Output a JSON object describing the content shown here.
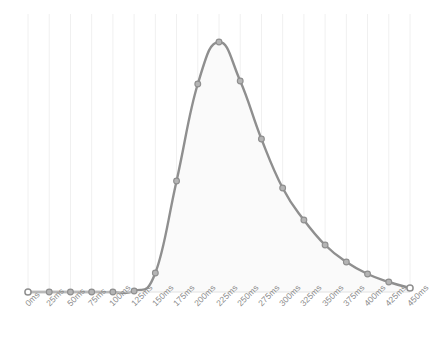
{
  "chart_data": {
    "type": "area",
    "title": "",
    "subtitle": "",
    "xlabel": "",
    "ylabel": "",
    "categories": [
      "0ms",
      "25ms",
      "50ms",
      "75ms",
      "100ms",
      "125ms",
      "150ms",
      "175ms",
      "200ms",
      "225ms",
      "250ms",
      "275ms",
      "300ms",
      "325ms",
      "350ms",
      "375ms",
      "400ms",
      "425ms",
      "450ms"
    ],
    "x": [
      0,
      25,
      50,
      75,
      100,
      125,
      150,
      175,
      200,
      225,
      250,
      275,
      300,
      325,
      350,
      375,
      400,
      425,
      450
    ],
    "values": [
      0,
      0,
      0,
      0,
      0,
      0.4,
      7.6,
      44.4,
      83.2,
      100,
      84.4,
      61.2,
      41.6,
      28.8,
      18.8,
      12.0,
      7.2,
      4.0,
      1.6
    ],
    "series": [
      {
        "name": "",
        "values": [
          0,
          0,
          0,
          0,
          0,
          0.4,
          7.6,
          44.4,
          83.2,
          100,
          84.4,
          61.2,
          41.6,
          28.8,
          18.8,
          12.0,
          7.2,
          4.0,
          1.6
        ]
      }
    ],
    "ylim": [
      0,
      100
    ],
    "xlim": [
      0,
      450
    ],
    "grid": true,
    "grid_axis": "x",
    "legend": false,
    "legend_position": "none",
    "markers": true,
    "marker_shape": "circle",
    "smooth": true,
    "annotations": [],
    "tick_label_rotation": -45,
    "colors": {
      "line": "#8f8f8f",
      "fill": "#fafafa",
      "marker_fill": "#b4b4b4",
      "marker_stroke": "#8f8f8f",
      "endpoint_fill": "#ffffff",
      "grid": "#f0f0f0",
      "tick_label": "#8a8a8a",
      "background": "#ffffff"
    }
  }
}
